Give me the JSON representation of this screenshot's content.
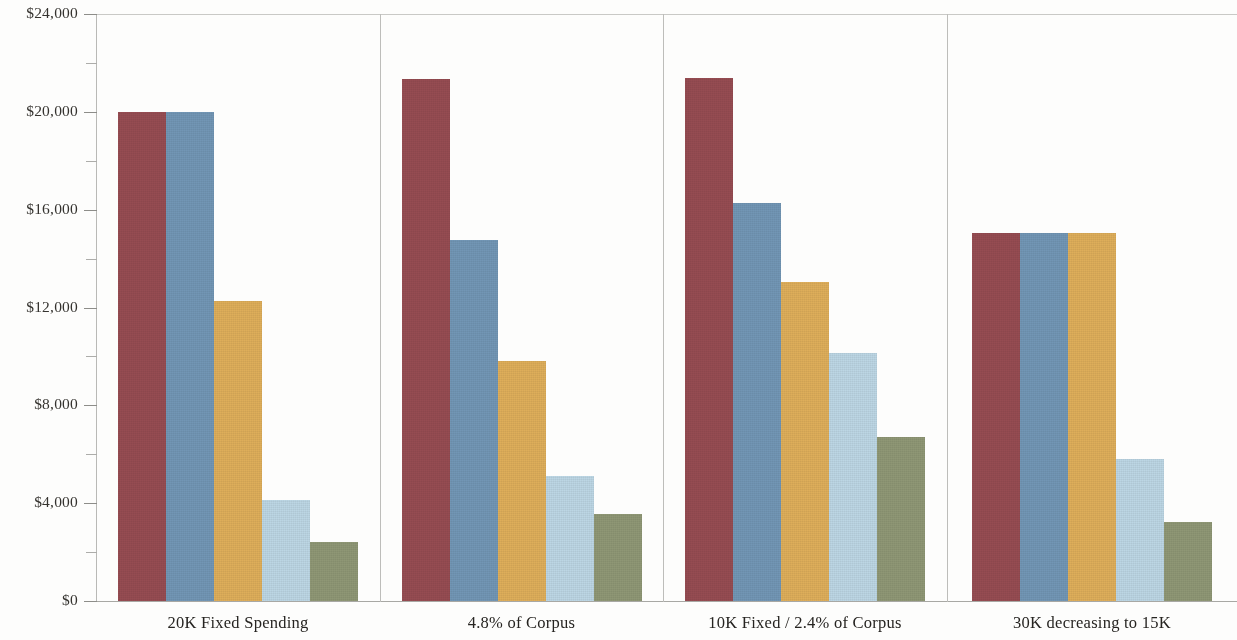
{
  "chart_data": {
    "type": "bar",
    "title": "",
    "subtitle": "",
    "xlabel": "",
    "ylabel": "",
    "grid": false,
    "legend_position": "none",
    "ylim": [
      0,
      24000
    ],
    "y_tick_labels": [
      "$24,000",
      "$20,000",
      "$16,000",
      "$12,000",
      "$8,000",
      "$4,000",
      "$0"
    ],
    "y_tick_values": [
      24000,
      20000,
      16000,
      12000,
      8000,
      4000,
      0
    ],
    "y_minor_tick_values": [
      22000,
      18000,
      14000,
      10000,
      6000,
      2000
    ],
    "categories": [
      "20K Fixed Spending",
      "4.8% of Corpus",
      "10K Fixed / 2.4% of Corpus",
      "30K decreasing to 15K"
    ],
    "series": [
      {
        "name": "series-1",
        "color": "#93464c",
        "values": [
          20000,
          21350,
          21400,
          15050
        ]
      },
      {
        "name": "series-2",
        "color": "#6d93b3",
        "values": [
          20000,
          14750,
          16270,
          15050
        ]
      },
      {
        "name": "series-3",
        "color": "#ddab55",
        "values": [
          12270,
          9800,
          13050,
          15050
        ]
      },
      {
        "name": "series-4",
        "color": "#bad5e3",
        "values": [
          4130,
          5100,
          10150,
          5800
        ]
      },
      {
        "name": "series-5",
        "color": "#8b9471",
        "values": [
          2410,
          3550,
          6700,
          3250
        ]
      }
    ]
  },
  "axis": {
    "y_max_label": "$24,000",
    "y_min_label": "$0"
  },
  "colors": {
    "series_1": "#93464c",
    "series_2": "#6d93b3",
    "series_3": "#ddab55",
    "series_4": "#bad5e3",
    "series_5": "#8b9471",
    "axis_line": "#b9b9b6",
    "divider": "#bdbdba",
    "text": "#2b2b2b",
    "background": "#fdfdfc"
  }
}
